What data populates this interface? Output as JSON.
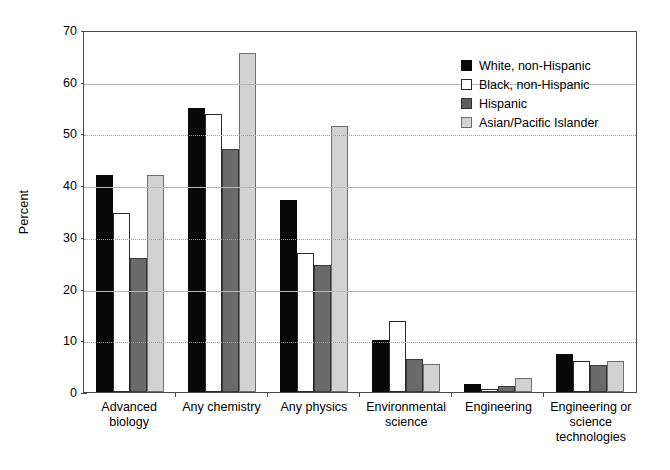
{
  "chart_data": {
    "type": "bar",
    "title": "",
    "xlabel": "",
    "ylabel": "Percent",
    "ylim": [
      0,
      70
    ],
    "yticks": [
      0,
      10,
      20,
      30,
      40,
      50,
      60,
      70
    ],
    "grid": true,
    "legend_position": "top-right",
    "categories": [
      "Advanced biology",
      "Any chemistry",
      "Any physics",
      "Environmental science",
      "Engineering",
      "Engineering or science technologies"
    ],
    "series": [
      {
        "name": "White, non-Hispanic",
        "color": "#080808",
        "values": [
          42.0,
          54.9,
          37.1,
          10.0,
          1.5,
          7.3
        ]
      },
      {
        "name": "Black, non-Hispanic",
        "color": "#ffffff",
        "values": [
          34.6,
          53.8,
          26.8,
          13.7,
          0.5,
          6.0
        ]
      },
      {
        "name": "Hispanic",
        "color": "#5f5f5f",
        "values": [
          25.9,
          46.9,
          24.5,
          6.4,
          1.2,
          5.3
        ]
      },
      {
        "name": "Asian/Pacific Islander",
        "color": "#d2d2d2",
        "values": [
          42.0,
          65.5,
          51.5,
          5.4,
          2.7,
          6.0
        ]
      }
    ]
  },
  "axis": {
    "y_title": "Percent",
    "y_tick_labels": [
      "70",
      "60",
      "50",
      "40",
      "30",
      "20",
      "10",
      "0"
    ]
  },
  "legend": {
    "items": [
      {
        "label": "White, non-Hispanic"
      },
      {
        "label": "Black, non-Hispanic"
      },
      {
        "label": "Hispanic"
      },
      {
        "label": "Asian/Pacific Islander"
      }
    ]
  },
  "x_axis": {
    "labels": [
      "Advanced biology",
      "Any chemistry",
      "Any physics",
      "Environmental science",
      "Engineering",
      "Engineering or science technologies"
    ]
  }
}
